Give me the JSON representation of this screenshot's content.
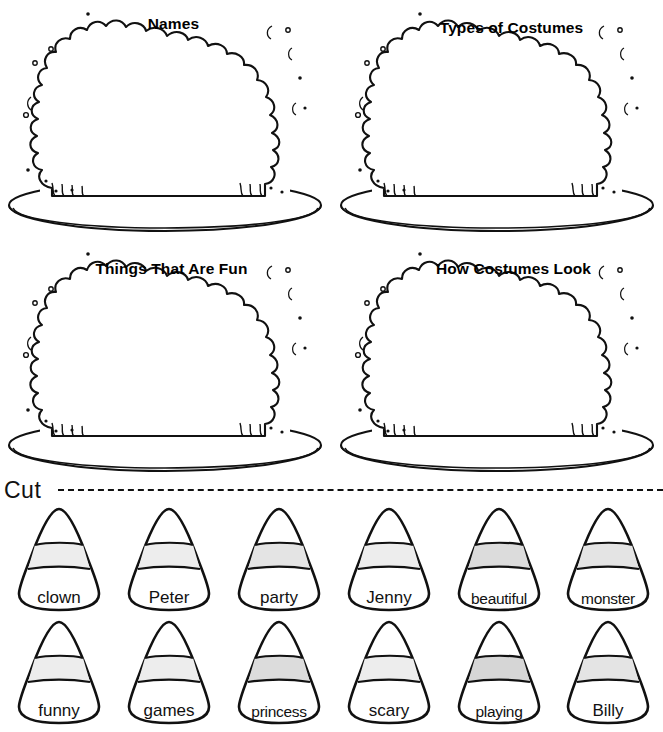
{
  "worksheet": {
    "cut_label": "Cut",
    "cakes": [
      {
        "title": "Names"
      },
      {
        "title": "Types of Costumes"
      },
      {
        "title": "Things That Are Fun"
      },
      {
        "title": "How Costumes Look"
      }
    ],
    "candy_rows": [
      {
        "items": [
          {
            "label": "clown"
          },
          {
            "label": "Peter"
          },
          {
            "label": "party"
          },
          {
            "label": "Jenny"
          },
          {
            "label": "beautiful"
          },
          {
            "label": "monster"
          }
        ]
      },
      {
        "items": [
          {
            "label": "funny"
          },
          {
            "label": "games"
          },
          {
            "label": "princess"
          },
          {
            "label": "scary"
          },
          {
            "label": "playing"
          },
          {
            "label": "Billy"
          }
        ]
      }
    ],
    "colors": {
      "ink": "#111111",
      "paper": "#ffffff",
      "candy_band_light": "#ededed",
      "candy_band_mid": "#e2e2e2"
    }
  }
}
